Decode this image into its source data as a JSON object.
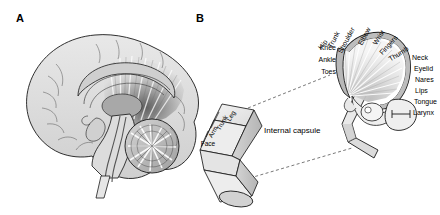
{
  "figure": {
    "panels": [
      {
        "id": "A",
        "letter": "A",
        "caption": "mid-sagittal brain section with corona radiata"
      },
      {
        "id": "B",
        "letter": "B",
        "caption": "motor homunculus and internal capsule somatotopy"
      }
    ]
  },
  "panelA": {
    "letter": "A",
    "structures": [
      "cerebral-cortex",
      "corpus-callosum",
      "corona-radiata",
      "thalamus",
      "brainstem",
      "cerebellum",
      "spinal-cord"
    ]
  },
  "panelB": {
    "letter": "B",
    "internal_capsule_label": "Internal capsule",
    "homunculus_labels_top": [
      "Hip",
      "Trunk",
      "Shoulder",
      "Elbow",
      "Wrist",
      "Fingers",
      "Thumb"
    ],
    "homunculus_labels_left": [
      "Hip",
      "Knee",
      "Ankle",
      "Toes"
    ],
    "homunculus_labels_right": [
      "Neck",
      "Eyelid",
      "Nares",
      "Lips",
      "Tongue",
      "Larynx"
    ],
    "capsule_segments": [
      "Leg",
      "Trunk",
      "Arm",
      "Face"
    ]
  },
  "colors": {
    "outline": "#1a1a1a",
    "tissue_light": "#e2e2e2",
    "tissue_mid": "#c9c9c9",
    "tissue_dark": "#8e8e8e",
    "fiber_dark": "#5a5a5a",
    "background": "#ffffff",
    "dashed": "#555555"
  }
}
